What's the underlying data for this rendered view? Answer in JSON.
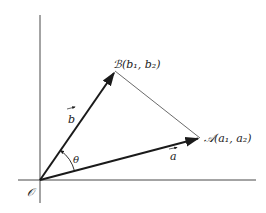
{
  "diagram": {
    "origin": {
      "label": "𝒪",
      "x": 40,
      "y": 180
    },
    "axes": {
      "vertical": {
        "x": 40,
        "y1": 15,
        "y2": 203
      },
      "horizontal": {
        "y": 180,
        "x1": 18,
        "x2": 256
      }
    },
    "points": {
      "B": {
        "label": "ℬ(b₁, b₂)",
        "x": 115,
        "y": 71
      },
      "A": {
        "label": "𝒜(a₁, a₂)",
        "x": 200,
        "y": 138
      }
    },
    "vectors": [
      {
        "name": "b",
        "label": "b",
        "from": "origin",
        "to": "B"
      },
      {
        "name": "a",
        "label": "a",
        "from": "origin",
        "to": "A"
      }
    ],
    "angle": {
      "label": "θ"
    },
    "segment": {
      "from": "B",
      "to": "A"
    },
    "colors": {
      "line": "#1a1a1a",
      "thin_line": "#444444",
      "background": "#ffffff"
    }
  }
}
